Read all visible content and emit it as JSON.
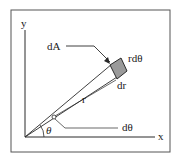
{
  "diagram": {
    "labels": {
      "y_axis": "y",
      "x_axis": "x",
      "dA": "dA",
      "r_dtheta": "rdθ",
      "dr": "dr",
      "r": "r",
      "theta": "θ",
      "dtheta": "dθ"
    },
    "colors": {
      "line": "#2a2a2a",
      "frame": "#555555",
      "element_fill": "#9a9a9a",
      "background": "#ffffff"
    }
  }
}
